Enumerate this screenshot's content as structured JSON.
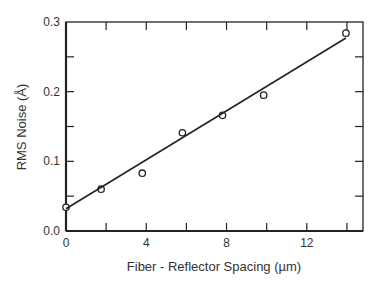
{
  "chart_data": {
    "type": "scatter",
    "title": "",
    "xlabel": "Fiber - Reflector Spacing (µm)",
    "ylabel": "RMS Noise (Å)",
    "xlim": [
      0,
      14.8
    ],
    "ylim": [
      0.0,
      0.3
    ],
    "x_ticks": [
      0,
      4,
      8,
      12
    ],
    "x_tick_labels": [
      "0",
      "4",
      "8",
      "12"
    ],
    "x_minor_ticks": [
      2,
      6,
      10,
      14
    ],
    "y_ticks": [
      0.0,
      0.1,
      0.2,
      0.3
    ],
    "y_tick_labels": [
      "0.0",
      "0.1",
      "0.2",
      "0.3"
    ],
    "y_minor_ticks": [
      0.05,
      0.15,
      0.25
    ],
    "grid": false,
    "legend": null,
    "series": [
      {
        "name": "measured",
        "marker": "open-circle",
        "x": [
          0,
          1.75,
          3.8,
          5.8,
          7.8,
          9.85,
          13.95
        ],
        "y": [
          0.034,
          0.06,
          0.083,
          0.141,
          0.166,
          0.195,
          0.284
        ]
      },
      {
        "name": "linear fit",
        "style": "line",
        "x": [
          0,
          13.95
        ],
        "y": [
          0.032,
          0.277
        ]
      }
    ]
  },
  "colors": {
    "ink": "#222222",
    "background": "#ffffff"
  }
}
